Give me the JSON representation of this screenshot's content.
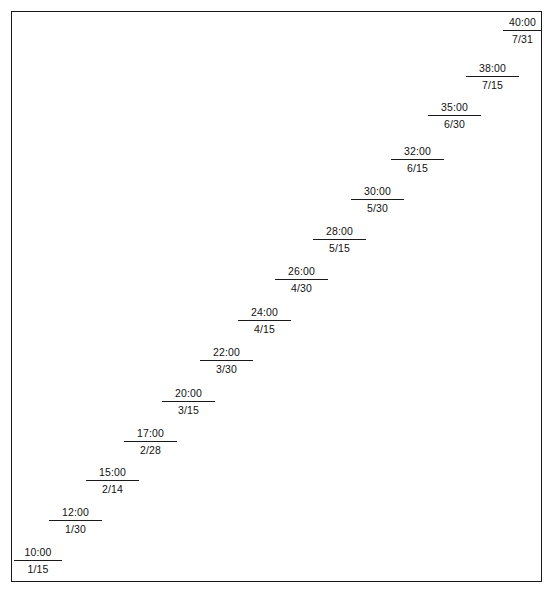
{
  "figure": {
    "title": "",
    "frame": {
      "visible": true,
      "color": "#1a1a1a"
    }
  },
  "chart_data": {
    "type": "scatter",
    "title": "",
    "xlabel": "",
    "ylabel": "",
    "grid": false,
    "legend": null,
    "note": "Staircase of labelled steps; each step shows a time value above a rule and a date below it. Values ascend left-to-right and bottom-to-top.",
    "categories": [
      "1/15",
      "1/30",
      "2/14",
      "2/28",
      "3/15",
      "3/30",
      "4/15",
      "4/30",
      "5/15",
      "5/30",
      "6/15",
      "6/30",
      "7/15",
      "7/31"
    ],
    "values": [
      "10:00",
      "12:00",
      "15:00",
      "17:00",
      "20:00",
      "22:00",
      "24:00",
      "26:00",
      "28:00",
      "30:00",
      "32:00",
      "35:00",
      "38:00",
      "40:00"
    ],
    "points": [
      {
        "value": "10:00",
        "date": "1/15",
        "x": 14,
        "y": 546,
        "width": 48
      },
      {
        "value": "12:00",
        "date": "1/30",
        "x": 49,
        "y": 506,
        "width": 53
      },
      {
        "value": "15:00",
        "date": "2/14",
        "x": 86,
        "y": 466,
        "width": 53
      },
      {
        "value": "17:00",
        "date": "2/28",
        "x": 124,
        "y": 427,
        "width": 53
      },
      {
        "value": "20:00",
        "date": "3/15",
        "x": 162,
        "y": 387,
        "width": 53
      },
      {
        "value": "22:00",
        "date": "3/30",
        "x": 200,
        "y": 346,
        "width": 53
      },
      {
        "value": "24:00",
        "date": "4/15",
        "x": 238,
        "y": 306,
        "width": 53
      },
      {
        "value": "26:00",
        "date": "4/30",
        "x": 275,
        "y": 265,
        "width": 53
      },
      {
        "value": "28:00",
        "date": "5/15",
        "x": 313,
        "y": 225,
        "width": 53
      },
      {
        "value": "30:00",
        "date": "5/30",
        "x": 351,
        "y": 185,
        "width": 53
      },
      {
        "value": "32:00",
        "date": "6/15",
        "x": 391,
        "y": 145,
        "width": 53
      },
      {
        "value": "35:00",
        "date": "6/30",
        "x": 428,
        "y": 101,
        "width": 53
      },
      {
        "value": "38:00",
        "date": "7/15",
        "x": 466,
        "y": 62,
        "width": 53
      },
      {
        "value": "40:00",
        "date": "7/31",
        "x": 503,
        "y": 16,
        "width": 39
      }
    ]
  },
  "artifact": {
    "text": " "
  }
}
